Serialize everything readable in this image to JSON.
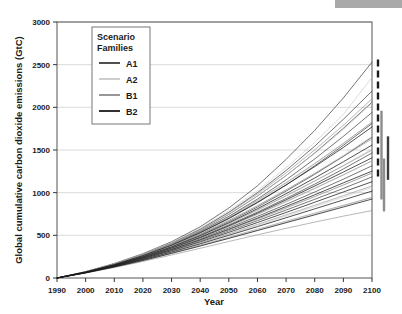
{
  "decor": {
    "top_bar_color": "#a9a9a9"
  },
  "chart_data": {
    "type": "line",
    "title": "",
    "xlabel": "Year",
    "ylabel": "Global cumulative carbon dioxide emissions (GtC)",
    "xlim": [
      1990,
      2100
    ],
    "ylim": [
      0,
      3000
    ],
    "xticks": [
      1990,
      2000,
      2010,
      2020,
      2030,
      2040,
      2050,
      2060,
      2070,
      2080,
      2090,
      2100
    ],
    "yticks": [
      0,
      500,
      1000,
      1500,
      2000,
      2500,
      3000
    ],
    "grid": "horizontal",
    "legend_position": "upper-left-inside",
    "legend_title": "Scenario Families",
    "x": [
      1990,
      2000,
      2010,
      2020,
      2030,
      2040,
      2050,
      2060,
      2070,
      2080,
      2090,
      2100
    ],
    "series": [
      {
        "name": "A1",
        "family": "A1",
        "color": "#3c3c3c",
        "values": [
          0,
          75,
          170,
          285,
          425,
          600,
          820,
          1080,
          1390,
          1730,
          2110,
          2530
        ]
      },
      {
        "name": "A1-2",
        "family": "A1",
        "color": "#3c3c3c",
        "values": [
          0,
          73,
          165,
          275,
          408,
          572,
          770,
          1000,
          1260,
          1545,
          1860,
          2190
        ]
      },
      {
        "name": "A1-3",
        "family": "A1",
        "color": "#3c3c3c",
        "values": [
          0,
          72,
          162,
          270,
          400,
          558,
          745,
          960,
          1200,
          1465,
          1755,
          2060
        ]
      },
      {
        "name": "A1-4",
        "family": "A1",
        "color": "#3c3c3c",
        "values": [
          0,
          71,
          160,
          266,
          392,
          545,
          722,
          925,
          1150,
          1395,
          1660,
          1940
        ]
      },
      {
        "name": "A1-5",
        "family": "A1",
        "color": "#3c3c3c",
        "values": [
          0,
          70,
          157,
          260,
          382,
          528,
          695,
          882,
          1090,
          1315,
          1555,
          1810
        ]
      },
      {
        "name": "A1-6",
        "family": "A1",
        "color": "#3c3c3c",
        "values": [
          0,
          69,
          154,
          254,
          370,
          508,
          662,
          832,
          1018,
          1215,
          1425,
          1650
        ]
      },
      {
        "name": "A1-7",
        "family": "A1",
        "color": "#3c3c3c",
        "values": [
          0,
          68,
          150,
          246,
          356,
          483,
          622,
          772,
          932,
          1100,
          1278,
          1465
        ]
      },
      {
        "name": "A1-8",
        "family": "A1",
        "color": "#3c3c3c",
        "values": [
          0,
          66,
          146,
          238,
          342,
          460,
          588,
          722,
          862,
          1008,
          1158,
          1315
        ]
      },
      {
        "name": "A1-9",
        "family": "A1",
        "color": "#3c3c3c",
        "values": [
          0,
          65,
          142,
          230,
          328,
          436,
          552,
          672,
          796,
          922,
          1050,
          1185
        ]
      },
      {
        "name": "A2",
        "family": "A2",
        "color": "#c8c8c8",
        "values": [
          0,
          74,
          168,
          280,
          415,
          582,
          788,
          1022,
          1292,
          1590,
          1918,
          2350
        ]
      },
      {
        "name": "A2-2",
        "family": "A2",
        "color": "#c8c8c8",
        "values": [
          0,
          72,
          163,
          272,
          402,
          560,
          748,
          962,
          1200,
          1460,
          1740,
          2050
        ]
      },
      {
        "name": "A2-3",
        "family": "A2",
        "color": "#c8c8c8",
        "values": [
          0,
          71,
          159,
          264,
          388,
          536,
          708,
          900,
          1110,
          1335,
          1575,
          1830
        ]
      },
      {
        "name": "A2-4",
        "family": "A2",
        "color": "#c8c8c8",
        "values": [
          0,
          70,
          155,
          256,
          374,
          512,
          670,
          845,
          1030,
          1228,
          1438,
          1660
        ]
      },
      {
        "name": "A2-5",
        "family": "A2",
        "color": "#c8c8c8",
        "values": [
          0,
          68,
          151,
          248,
          360,
          490,
          635,
          792,
          958,
          1133,
          1318,
          1512
        ]
      },
      {
        "name": "A2-6",
        "family": "A2",
        "color": "#c8c8c8",
        "values": [
          0,
          67,
          147,
          240,
          346,
          467,
          600,
          742,
          890,
          1045,
          1205,
          1372
        ]
      },
      {
        "name": "A2-7",
        "family": "A2",
        "color": "#c8c8c8",
        "values": [
          0,
          65,
          142,
          230,
          330,
          442,
          562,
          688,
          818,
          952,
          1090,
          1232
        ]
      },
      {
        "name": "A2-8",
        "family": "A2",
        "color": "#c8c8c8",
        "values": [
          0,
          62,
          134,
          216,
          306,
          404,
          508,
          615,
          725,
          835,
          948,
          1060
        ]
      },
      {
        "name": "A2-9",
        "family": "A2",
        "color": "#c8c8c8",
        "values": [
          0,
          60,
          128,
          205,
          288,
          375,
          465,
          558,
          652,
          748,
          845,
          942
        ]
      },
      {
        "name": "B1",
        "family": "B1",
        "color": "#8c8c8c",
        "values": [
          0,
          73,
          166,
          276,
          408,
          570,
          765,
          985,
          1232,
          1502,
          1790,
          2100
        ]
      },
      {
        "name": "B1-2",
        "family": "B1",
        "color": "#8c8c8c",
        "values": [
          0,
          71,
          160,
          266,
          392,
          542,
          718,
          910,
          1118,
          1342,
          1578,
          1825
        ]
      },
      {
        "name": "B1-3",
        "family": "B1",
        "color": "#8c8c8c",
        "values": [
          0,
          70,
          156,
          258,
          376,
          516,
          675,
          848,
          1032,
          1225,
          1425,
          1630
        ]
      },
      {
        "name": "B1-4",
        "family": "B1",
        "color": "#8c8c8c",
        "values": [
          0,
          68,
          152,
          250,
          362,
          493,
          640,
          798,
          965,
          1138,
          1315,
          1498
        ]
      },
      {
        "name": "B1-5",
        "family": "B1",
        "color": "#8c8c8c",
        "values": [
          0,
          67,
          148,
          242,
          348,
          470,
          605,
          748,
          898,
          1052,
          1210,
          1372
        ]
      },
      {
        "name": "B1-6",
        "family": "B1",
        "color": "#8c8c8c",
        "values": [
          0,
          65,
          143,
          232,
          332,
          444,
          565,
          692,
          822,
          955,
          1090,
          1228
        ]
      },
      {
        "name": "B1-7",
        "family": "B1",
        "color": "#8c8c8c",
        "values": [
          0,
          63,
          137,
          220,
          312,
          412,
          518,
          628,
          740,
          852,
          965,
          1078
        ]
      },
      {
        "name": "B1-8",
        "family": "B1",
        "color": "#8c8c8c",
        "values": [
          0,
          61,
          131,
          209,
          294,
          385,
          478,
          572,
          666,
          760,
          852,
          945
        ]
      },
      {
        "name": "B1-9",
        "family": "B1",
        "color": "#8c8c8c",
        "values": [
          0,
          58,
          123,
          194,
          270,
          348,
          428,
          506,
          582,
          655,
          725,
          790
        ]
      },
      {
        "name": "B2",
        "family": "B2",
        "color": "#1a1a1a",
        "values": [
          0,
          70,
          158,
          262,
          385,
          532,
          700,
          888,
          1090,
          1305,
          1530,
          1770
        ]
      },
      {
        "name": "B2-2",
        "family": "B2",
        "color": "#1a1a1a",
        "values": [
          0,
          68,
          152,
          250,
          364,
          497,
          648,
          812,
          988,
          1172,
          1362,
          1558
        ]
      },
      {
        "name": "B2-3",
        "family": "B2",
        "color": "#1a1a1a",
        "values": [
          0,
          67,
          148,
          242,
          350,
          474,
          612,
          760,
          916,
          1078,
          1242,
          1408
        ]
      },
      {
        "name": "B2-4",
        "family": "B2",
        "color": "#1a1a1a",
        "values": [
          0,
          65,
          143,
          233,
          334,
          448,
          572,
          702,
          838,
          975,
          1115,
          1252
        ]
      },
      {
        "name": "B2-5",
        "family": "B2",
        "color": "#1a1a1a",
        "values": [
          0,
          64,
          139,
          224,
          320,
          424,
          535,
          650,
          768,
          888,
          1008,
          1128
        ]
      },
      {
        "name": "B2-6",
        "family": "B2",
        "color": "#1a1a1a",
        "values": [
          0,
          62,
          134,
          215,
          304,
          400,
          500,
          602,
          706,
          810,
          915,
          1018
        ]
      },
      {
        "name": "B2-7",
        "family": "B2",
        "color": "#1a1a1a",
        "values": [
          0,
          60,
          129,
          205,
          288,
          375,
          465,
          556,
          648,
          740,
          832,
          925
        ]
      }
    ],
    "legend_entries": [
      {
        "label": "A1",
        "color": "#3c3c3c"
      },
      {
        "label": "A2",
        "color": "#c8c8c8"
      },
      {
        "label": "B1",
        "color": "#8c8c8c"
      },
      {
        "label": "B2",
        "color": "#1a1a1a"
      }
    ],
    "range_bars": [
      {
        "family": "A1",
        "color": "#1a1a1a",
        "low": 1150,
        "high": 2560,
        "dashed": true
      },
      {
        "family": "A2",
        "color": "#8c8c8c",
        "low": 920,
        "high": 1960,
        "dashed": false
      },
      {
        "family": "B1",
        "color": "#3c3c3c",
        "low": 1150,
        "high": 1660,
        "dashed": false
      },
      {
        "family": "B2",
        "color": "#8c8c8c",
        "low": 780,
        "high": 1400,
        "dashed": false
      }
    ]
  }
}
